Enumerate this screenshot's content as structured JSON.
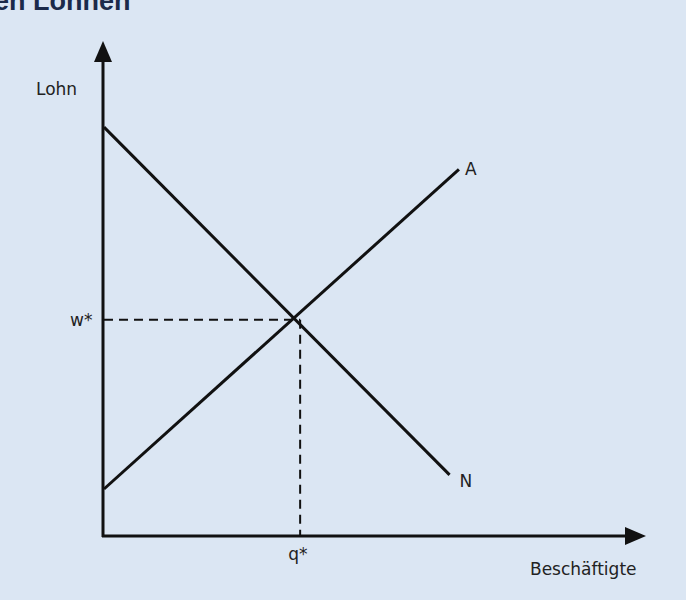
{
  "title": "en Löhnen",
  "chart_data": {
    "type": "line",
    "title": "",
    "xlabel": "Beschäftigte",
    "ylabel": "Lohn",
    "xlim": [
      0,
      10
    ],
    "ylim": [
      0,
      10
    ],
    "series": [
      {
        "name": "N",
        "label": "N",
        "points": [
          [
            0,
            8.7
          ],
          [
            7.4,
            1.3
          ]
        ]
      },
      {
        "name": "A",
        "label": "A",
        "points": [
          [
            0,
            1.0
          ],
          [
            7.6,
            7.8
          ]
        ]
      }
    ],
    "equilibrium": {
      "x": 4.2,
      "y": 4.6,
      "xlabel": "q*",
      "ylabel": "w*"
    }
  }
}
